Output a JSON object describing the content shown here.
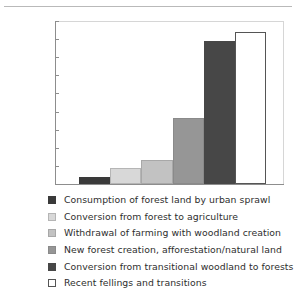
{
  "chart_data": {
    "type": "bar",
    "title": "",
    "xlabel": "",
    "ylabel": "",
    "ylim": [
      0,
      180000
    ],
    "ytick_labels": [
      "180 000",
      "160 000",
      "140 000",
      "120 000",
      "100 000",
      "80 000",
      "60 000",
      "40 000",
      "20 000",
      "0"
    ],
    "ytick_values": [
      180000,
      160000,
      140000,
      120000,
      100000,
      80000,
      60000,
      40000,
      20000,
      0
    ],
    "grid": false,
    "legend_position": "below",
    "categories": [
      "Consumption of forest land by urban sprawl",
      "Conversion from forest to agriculture",
      "Withdrawal of farming with woodland creation",
      "New forest creation, afforestation/natural land",
      "Conversion from transitional woodland to forests",
      "Recent fellings and transitions"
    ],
    "values": [
      7800,
      18000,
      26500,
      73000,
      157500,
      168000
    ],
    "colors": [
      "#3a3a3a",
      "#d8d8d8",
      "#c2c2c2",
      "#969696",
      "#474747",
      "#ffffff"
    ],
    "border_colors": [
      "#3a3a3a",
      "#b5b5b5",
      "#a8a8a8",
      "#8a8a8a",
      "#474747",
      "#555555"
    ]
  },
  "legend": {
    "items": [
      {
        "label": "Consumption of forest land by urban sprawl"
      },
      {
        "label": "Conversion from forest to agriculture"
      },
      {
        "label": "Withdrawal of farming with woodland creation"
      },
      {
        "label": "New forest creation, afforestation/natural land"
      },
      {
        "label": "Conversion from transitional woodland to forests"
      },
      {
        "label": "Recent fellings and transitions"
      }
    ]
  }
}
